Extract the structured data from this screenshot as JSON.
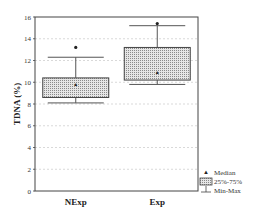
{
  "chart_data": {
    "type": "box",
    "title": "",
    "xlabel": "",
    "ylabel": "TDNA (%)",
    "ylim": [
      0,
      16
    ],
    "yticks": [
      0,
      2,
      4,
      6,
      8,
      10,
      12,
      14,
      16
    ],
    "grid": true,
    "categories": [
      "NExp",
      "Exp"
    ],
    "series": [
      {
        "name": "NExp",
        "min": 8.1,
        "q1": 8.6,
        "median": 9.8,
        "q3": 10.4,
        "max": 12.3,
        "outliers": [
          13.2
        ]
      },
      {
        "name": "Exp",
        "min": 9.8,
        "q1": 10.2,
        "median": 10.9,
        "q3": 13.2,
        "max": 15.2,
        "outliers": [
          15.4
        ]
      }
    ],
    "legend": {
      "position": "bottom-right",
      "entries": [
        "Median",
        "25%-75%",
        "Min-Max"
      ]
    }
  }
}
